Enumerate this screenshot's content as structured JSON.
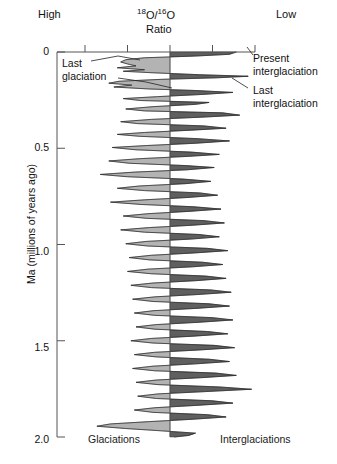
{
  "header": {
    "left_label": "High",
    "right_label": "Low",
    "ratio_numerator_sup": "18",
    "ratio_numerator_el": "O",
    "ratio_slash": "/",
    "ratio_denominator_sup": "16",
    "ratio_denominator_el": "O",
    "ratio_word": "Ratio"
  },
  "annotations": {
    "last_glaciation": "Last\nglaciation",
    "last_glaciation_line1": "Last",
    "last_glaciation_line2": "glaciation",
    "present_interglaciation_line1": "Present",
    "present_interglaciation_line2": "interglaciation",
    "last_interglaciation_line1": "Last",
    "last_interglaciation_line2": "interglaciation"
  },
  "footer": {
    "left_label": "Glaciations",
    "right_label": "Interglaciations"
  },
  "axis": {
    "y_title": "Ma (millions of years ago)",
    "y_ticks": [
      "0",
      "0.5",
      "1.0",
      "1.5",
      "2.0"
    ],
    "y_tick_values": [
      0,
      0.5,
      1.0,
      1.5,
      2.0
    ],
    "y_min": 0,
    "y_max": 2.0
  },
  "colors": {
    "glacial_fill": "#b3b3b3",
    "interglacial_fill": "#5f5f5f",
    "axis": "#555555",
    "text": "#111111",
    "background": "#ffffff"
  },
  "chart_data": {
    "type": "area",
    "title": "",
    "subtitle": "",
    "xlabel": "18O / 16O Ratio",
    "ylabel": "Ma (millions of years ago)",
    "xlim": [
      -1,
      1
    ],
    "ylim": [
      2.0,
      0
    ],
    "grid": false,
    "legend": "none",
    "orientation": "vertical-time-downward",
    "x_direction_note": "High 18O/16O ratio to the left (glacial), Low to the right (interglacial)",
    "top_axis_ticks_x": [
      -1.0,
      -0.5,
      0.0,
      0.5,
      1.0
    ],
    "zero_line_x": 0.0,
    "series": [
      {
        "name": "delta-18O (normalized, negative = glacial / high ratio, positive = interglacial / low ratio)",
        "age_ma": [
          0.0,
          0.012,
          0.021,
          0.03,
          0.04,
          0.052,
          0.062,
          0.072,
          0.082,
          0.092,
          0.1,
          0.108,
          0.118,
          0.126,
          0.134,
          0.142,
          0.152,
          0.162,
          0.172,
          0.182,
          0.192,
          0.2,
          0.21,
          0.22,
          0.232,
          0.242,
          0.252,
          0.262,
          0.272,
          0.284,
          0.296,
          0.306,
          0.316,
          0.328,
          0.338,
          0.35,
          0.362,
          0.372,
          0.384,
          0.396,
          0.406,
          0.418,
          0.428,
          0.438,
          0.45,
          0.462,
          0.474,
          0.486,
          0.496,
          0.508,
          0.52,
          0.532,
          0.542,
          0.554,
          0.566,
          0.578,
          0.59,
          0.6,
          0.612,
          0.624,
          0.636,
          0.648,
          0.66,
          0.672,
          0.684,
          0.696,
          0.708,
          0.72,
          0.732,
          0.744,
          0.756,
          0.768,
          0.78,
          0.792,
          0.804,
          0.816,
          0.828,
          0.84,
          0.852,
          0.864,
          0.876,
          0.888,
          0.9,
          0.912,
          0.924,
          0.936,
          0.948,
          0.96,
          0.972,
          0.984,
          0.996,
          1.008,
          1.02,
          1.032,
          1.044,
          1.056,
          1.068,
          1.08,
          1.092,
          1.104,
          1.116,
          1.128,
          1.14,
          1.152,
          1.164,
          1.176,
          1.188,
          1.2,
          1.212,
          1.224,
          1.236,
          1.248,
          1.26,
          1.272,
          1.284,
          1.296,
          1.308,
          1.32,
          1.332,
          1.344,
          1.356,
          1.368,
          1.38,
          1.392,
          1.404,
          1.416,
          1.428,
          1.44,
          1.452,
          1.464,
          1.476,
          1.488,
          1.5,
          1.512,
          1.524,
          1.536,
          1.548,
          1.56,
          1.572,
          1.584,
          1.596,
          1.608,
          1.62,
          1.632,
          1.644,
          1.656,
          1.668,
          1.68,
          1.692,
          1.704,
          1.716,
          1.728,
          1.74,
          1.752,
          1.764,
          1.776,
          1.788,
          1.8,
          1.812,
          1.824,
          1.836,
          1.848,
          1.86,
          1.872,
          1.884,
          1.896,
          1.908,
          1.92,
          1.932,
          1.944,
          1.956,
          1.968,
          1.98,
          1.992,
          2.0
        ],
        "values": [
          0.78,
          0.7,
          0.3,
          -0.3,
          -0.52,
          -0.58,
          -0.5,
          -0.4,
          -0.62,
          -0.3,
          -0.55,
          -0.2,
          0.35,
          0.92,
          0.55,
          -0.1,
          -0.6,
          -0.72,
          -0.45,
          -0.66,
          -0.25,
          0.3,
          0.74,
          0.4,
          -0.15,
          -0.55,
          -0.35,
          0.46,
          0.3,
          -0.2,
          -0.52,
          -0.3,
          0.62,
          0.82,
          0.4,
          -0.22,
          -0.58,
          -0.38,
          0.4,
          0.66,
          0.25,
          -0.3,
          -0.62,
          -0.36,
          0.32,
          0.7,
          0.3,
          -0.28,
          -0.68,
          -0.4,
          0.25,
          0.58,
          0.22,
          -0.35,
          -0.72,
          -0.48,
          0.18,
          0.52,
          0.2,
          -0.42,
          -0.82,
          -0.5,
          0.15,
          0.48,
          0.18,
          -0.36,
          -0.62,
          -0.3,
          0.35,
          0.56,
          0.2,
          -0.3,
          -0.7,
          -0.34,
          0.28,
          0.6,
          0.22,
          -0.26,
          -0.55,
          -0.28,
          0.4,
          0.64,
          0.26,
          -0.24,
          -0.58,
          -0.3,
          0.34,
          0.58,
          0.24,
          -0.28,
          -0.52,
          -0.26,
          0.44,
          0.68,
          0.28,
          -0.22,
          -0.48,
          -0.24,
          0.38,
          0.62,
          0.26,
          -0.26,
          -0.5,
          -0.22,
          0.42,
          0.66,
          0.3,
          -0.2,
          -0.46,
          -0.22,
          0.48,
          0.72,
          0.32,
          -0.18,
          -0.44,
          -0.2,
          0.46,
          0.7,
          0.3,
          -0.2,
          -0.42,
          -0.18,
          0.5,
          0.74,
          0.34,
          -0.16,
          -0.4,
          -0.18,
          0.44,
          0.68,
          0.28,
          -0.22,
          -0.46,
          -0.2,
          0.52,
          0.76,
          0.34,
          -0.18,
          -0.42,
          -0.16,
          0.46,
          0.7,
          0.3,
          -0.2,
          -0.44,
          -0.18,
          0.54,
          0.78,
          0.36,
          -0.16,
          -0.4,
          -0.14,
          0.58,
          0.96,
          0.42,
          -0.14,
          -0.38,
          -0.16,
          0.5,
          0.74,
          0.3,
          -0.18,
          -0.42,
          -0.2,
          0.44,
          0.66,
          0.26,
          -0.24,
          -0.7,
          -0.86,
          -0.52,
          -0.1,
          0.3,
          0.22,
          0.05
        ]
      }
    ],
    "annotations": [
      {
        "text": "Last glaciation",
        "age_ma": 0.03,
        "side": "left"
      },
      {
        "text": "Present interglaciation",
        "age_ma": 0.005,
        "side": "right"
      },
      {
        "text": "Last interglaciation",
        "age_ma": 0.125,
        "side": "right"
      }
    ],
    "region_labels": {
      "left": "Glaciations",
      "right": "Interglaciations"
    }
  }
}
